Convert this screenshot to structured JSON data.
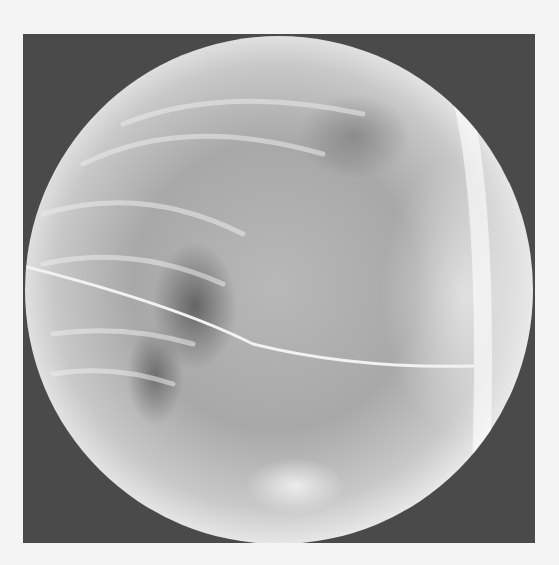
{
  "image": {
    "description": "Circular fluoroscopic X-ray image of the chest in lateral view, showing ribs, spine, and a thin catheter/wire crossing horizontally",
    "frame_color": "#4a4a4a",
    "background_color": "#f4f4f4",
    "circle": {
      "cx": 279,
      "cy": 289,
      "r": 254
    }
  }
}
